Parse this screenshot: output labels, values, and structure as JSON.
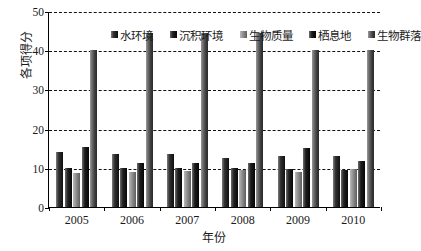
{
  "chart_data": {
    "type": "bar",
    "title": "",
    "xlabel": "年份",
    "ylabel": "各项得分",
    "categories": [
      "2005",
      "2006",
      "2007",
      "2008",
      "2009",
      "2010"
    ],
    "ylim": [
      0,
      50
    ],
    "yticks": [
      0,
      10,
      20,
      30,
      40,
      50
    ],
    "grid": true,
    "legend_position": "top-inside",
    "series": [
      {
        "name": "水环境",
        "values": [
          14.0,
          13.5,
          13.5,
          12.5,
          13.0,
          13.0
        ]
      },
      {
        "name": "沉积环境",
        "values": [
          10.0,
          10.0,
          10.0,
          9.9,
          9.8,
          9.4
        ]
      },
      {
        "name": "生物质量",
        "values": [
          8.8,
          9.0,
          9.3,
          9.4,
          8.9,
          9.8
        ]
      },
      {
        "name": "栖息地",
        "values": [
          15.2,
          11.3,
          11.3,
          11.2,
          15.0,
          11.8
        ]
      },
      {
        "name": "生物群落",
        "values": [
          40.0,
          44.5,
          44.3,
          44.5,
          40.0,
          40.0
        ]
      }
    ]
  }
}
